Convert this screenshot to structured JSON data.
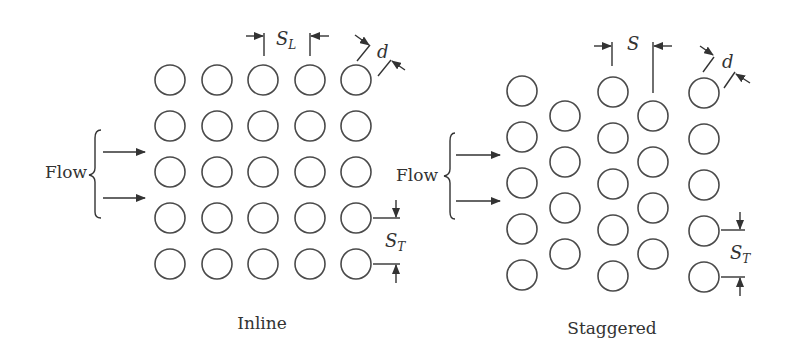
{
  "diagrams": [
    {
      "id": "inline",
      "caption": "Inline",
      "flow_label": "Flow",
      "dimension_labels": {
        "longitudinal": "S",
        "longitudinal_sub": "L",
        "diameter": "d",
        "transverse": "S",
        "transverse_sub": "T"
      },
      "columns_x": [
        170,
        217,
        263,
        310,
        356
      ],
      "rows_y": [
        80,
        126,
        172,
        218,
        264
      ],
      "radius": 15
    },
    {
      "id": "staggered",
      "caption": "Staggered",
      "flow_label": "Flow",
      "dimension_labels": {
        "pitch": "S",
        "diameter": "d",
        "transverse": "S",
        "transverse_sub": "T"
      },
      "columns": [
        {
          "x": 522,
          "rows_y": [
            91,
            137,
            183,
            229,
            275
          ]
        },
        {
          "x": 565,
          "rows_y": [
            116,
            162,
            208,
            254
          ]
        },
        {
          "x": 613,
          "rows_y": [
            92,
            138,
            184,
            230,
            276
          ]
        },
        {
          "x": 653,
          "rows_y": [
            116,
            162,
            208,
            254
          ]
        },
        {
          "x": 704,
          "rows_y": [
            93,
            139,
            185,
            231,
            277
          ]
        }
      ],
      "radius": 15
    }
  ],
  "colors": {
    "stroke": "#4a4a4a",
    "text": "#333333",
    "background": "#ffffff"
  }
}
